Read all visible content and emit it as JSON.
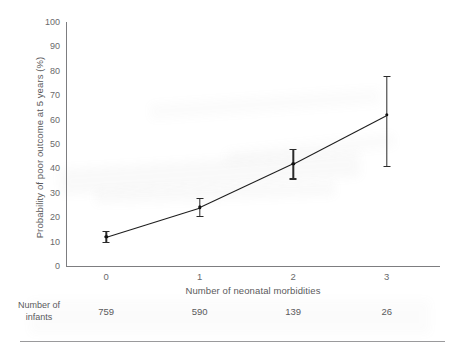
{
  "chart_data": {
    "type": "line",
    "title": "",
    "xlabel": "Number of neonatal morbidities",
    "ylabel": "Probability of poor outcome at 5 years (%)",
    "categories": [
      "0",
      "1",
      "2",
      "3"
    ],
    "x": [
      0,
      1,
      2,
      3
    ],
    "values": [
      12,
      24,
      42,
      62
    ],
    "error_low": [
      10,
      20.5,
      36,
      41
    ],
    "error_high": [
      14.5,
      28,
      48,
      78
    ],
    "xlim": [
      -0.43,
      3.57
    ],
    "ylim": [
      0,
      100
    ],
    "ytick_labels": [
      "0",
      "10",
      "20",
      "30",
      "40",
      "50",
      "60",
      "70",
      "80",
      "90",
      "100"
    ],
    "ytick_values": [
      0,
      10,
      20,
      30,
      40,
      50,
      60,
      70,
      80,
      90,
      100
    ],
    "xtick_labels": [
      "0",
      "1",
      "2",
      "3"
    ],
    "grid": false,
    "legend": "none",
    "series": [
      {
        "name": "Probability of poor outcome at 5 years",
        "values": [
          12,
          24,
          42,
          62
        ]
      }
    ],
    "line_color": "#1d1d1d",
    "error_bar_color": "#2a2a2a",
    "axis_color": "#7d7d80",
    "text_color": "#5a5a5c"
  },
  "counts_table": {
    "label": "Number of\ninfants",
    "label_line1": "Number of",
    "label_line2": "infants",
    "values": [
      "759",
      "590",
      "139",
      "26"
    ]
  }
}
